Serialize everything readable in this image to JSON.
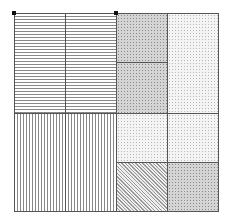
{
  "diagram": {
    "type": "treemap-like rectangle partition",
    "bounds": {
      "x": 14,
      "y": 13,
      "width": 204,
      "height": 198
    },
    "cells": [
      {
        "id": "top-left-a",
        "x": 14,
        "y": 13,
        "w": 51,
        "h": 100,
        "pattern": "horizontal-lines"
      },
      {
        "id": "top-left-b",
        "x": 65,
        "y": 13,
        "w": 51,
        "h": 100,
        "pattern": "horizontal-lines"
      },
      {
        "id": "bottom-left-a",
        "x": 14,
        "y": 113,
        "w": 51,
        "h": 98,
        "pattern": "vertical-lines"
      },
      {
        "id": "bottom-left-b",
        "x": 65,
        "y": 113,
        "w": 51,
        "h": 98,
        "pattern": "vertical-lines"
      },
      {
        "id": "top-mid-upper",
        "x": 116,
        "y": 13,
        "w": 51,
        "h": 49,
        "pattern": "dense-dots"
      },
      {
        "id": "top-mid-lower",
        "x": 116,
        "y": 62,
        "w": 51,
        "h": 51,
        "pattern": "dense-dots"
      },
      {
        "id": "top-right",
        "x": 167,
        "y": 13,
        "w": 51,
        "h": 100,
        "pattern": "light-dots"
      },
      {
        "id": "bottom-mid-upper",
        "x": 116,
        "y": 113,
        "w": 51,
        "h": 49,
        "pattern": "light-dots"
      },
      {
        "id": "bottom-right-upper",
        "x": 167,
        "y": 113,
        "w": 51,
        "h": 49,
        "pattern": "light-dots"
      },
      {
        "id": "bottom-mid-lower",
        "x": 116,
        "y": 162,
        "w": 51,
        "h": 49,
        "pattern": "diagonal-lines"
      },
      {
        "id": "bottom-right-lower",
        "x": 167,
        "y": 162,
        "w": 51,
        "h": 49,
        "pattern": "dense-dots"
      }
    ],
    "markers": [
      {
        "id": "corner-top-left",
        "x": 14,
        "y": 13
      },
      {
        "id": "corner-top-mid",
        "x": 116,
        "y": 13
      }
    ]
  }
}
